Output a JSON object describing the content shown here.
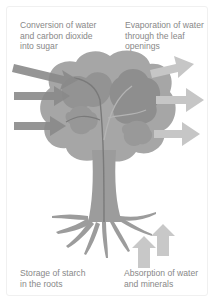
{
  "diagram": {
    "labels": {
      "top_left": "Conversion of water\nand carbon dioxide\ninto sugar",
      "top_right": "Evaporation of water\nthrough the leaf\nopenings",
      "bottom_left": "Storage of starch\nin the roots",
      "bottom_right": "Absorption of water\nand minerals"
    },
    "colors": {
      "canopy_outer": "#a3a3a3",
      "canopy_inner": "#8f8f8f",
      "trunk": "#9a9a9a",
      "inflow_arrow": "#8a8a8a",
      "outflow_arrow": "#c4c4c4",
      "root_arrow": "#c8c8c8",
      "text": "#888888"
    },
    "arrows": {
      "inflow_count": 3,
      "outflow_count": 3,
      "root_upward_count": 2
    }
  }
}
